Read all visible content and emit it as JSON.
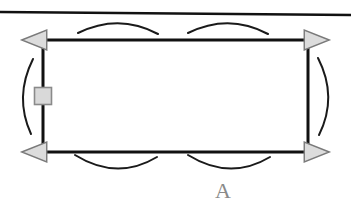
{
  "figure": {
    "label": "A",
    "label_color": "#8a8a8a",
    "stroke_color": "#111111",
    "arc_color": "#1a1a1a",
    "arrow_fill": "#dcdcdc",
    "arrow_stroke": "#7a7a7a",
    "marker_fill": "#d9d9d9",
    "marker_stroke": "#8a8a8a",
    "background": "#ffffff",
    "rectangle": {
      "name": "loop-rectangle",
      "x": 43,
      "y": 40,
      "width": 265,
      "height": 112,
      "stroke_width": 3
    },
    "top_line": {
      "name": "upper-boundary-line",
      "x1": 0,
      "y1": 12,
      "x2": 351,
      "y2": 15,
      "stroke_width": 2.5
    },
    "marker_square": {
      "name": "edge-marker-square",
      "cx": 43,
      "cy": 96,
      "size": 17
    },
    "arrowheads": [
      {
        "name": "arrowhead-top-left",
        "x": 43,
        "y": 40,
        "direction": "left"
      },
      {
        "name": "arrowhead-top-right",
        "x": 308,
        "y": 40,
        "direction": "right"
      },
      {
        "name": "arrowhead-bottom-left",
        "x": 43,
        "y": 152,
        "direction": "left"
      },
      {
        "name": "arrowhead-bottom-right",
        "x": 308,
        "y": 152,
        "direction": "right"
      }
    ],
    "arcs": [
      {
        "name": "arc-top-left",
        "d": "M 78 33 Q 119 13 158 34",
        "position": "top"
      },
      {
        "name": "arc-top-right",
        "d": "M 188 33 Q 229 13 268 34",
        "position": "top"
      },
      {
        "name": "arc-bottom-left",
        "d": "M 75 155 Q 117 181 157 157",
        "position": "bottom"
      },
      {
        "name": "arc-bottom-right",
        "d": "M 188 155 Q 230 181 270 157",
        "position": "bottom"
      },
      {
        "name": "arc-left",
        "d": "M 33 59 Q 14 97 31 134",
        "position": "left"
      },
      {
        "name": "arc-right",
        "d": "M 318 58 Q 338 97 319 135",
        "position": "right"
      }
    ]
  }
}
